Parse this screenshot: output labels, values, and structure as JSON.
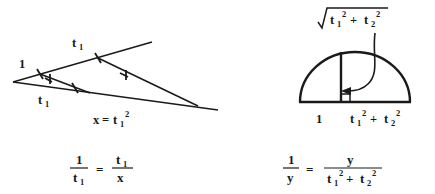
{
  "figure": {
    "background_color": "#ffffff",
    "ink_color": "#1a1a1a",
    "width": 435,
    "height": 194
  },
  "left_diagram": {
    "name": "similar-triangles-construction",
    "description": "Two nested triangles from a common apex with equal tick marks showing similar triangles",
    "labels": {
      "unit_segment": "1",
      "upper_segment": "t",
      "upper_segment_sub": "1",
      "lower_segment": "t",
      "lower_segment_sub": "1",
      "base_equation_lhs": "x",
      "base_equation_eq": "=",
      "base_equation_rhs": "t",
      "base_equation_rhs_sub": "1",
      "base_equation_rhs_sup": "2"
    }
  },
  "right_diagram": {
    "name": "semicircle-altitude-construction",
    "description": "Semicircle with inscribed altitude at the right angle, geometric mean construction",
    "labels": {
      "top_radical_symbol": "√",
      "top_expr_t1": "t",
      "top_expr_t1_sub": "1",
      "top_expr_t1_sup": "2",
      "top_expr_plus": "+",
      "top_expr_t2": "t",
      "top_expr_t2_sub": "2",
      "top_expr_t2_sup": "2",
      "base_left": "1",
      "base_right_t1": "t",
      "base_right_t1_sub": "1",
      "base_right_t1_sup": "2",
      "base_right_plus": "+",
      "base_right_t2": "t",
      "base_right_t2_sub": "2",
      "base_right_t2_sup": "2"
    }
  },
  "left_equation": {
    "name": "proportion-t1",
    "numerator_left": "1",
    "denominator_left": "t",
    "denominator_left_sub": "1",
    "equals": "=",
    "numerator_right": "t",
    "numerator_right_sub": "1",
    "denominator_right": "x"
  },
  "right_equation": {
    "name": "proportion-y",
    "numerator_left": "1",
    "denominator_left": "y",
    "equals": "=",
    "numerator_right": "y",
    "denominator_right_t1": "t",
    "denominator_right_t1_sub": "1",
    "denominator_right_t1_sup": "2",
    "denominator_right_plus": "+",
    "denominator_right_t2": "t",
    "denominator_right_t2_sub": "2",
    "denominator_right_t2_sup": "2"
  }
}
